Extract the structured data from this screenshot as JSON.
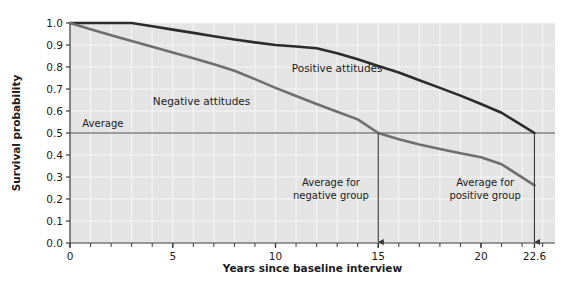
{
  "chart_data": {
    "type": "line",
    "title": "",
    "xlabel": "Years since baseline interview",
    "ylabel": "Survival probability",
    "xlim": [
      0,
      23.6
    ],
    "ylim": [
      0,
      1.0
    ],
    "grid": true,
    "legend_position": "inline-annotations",
    "xticks": [
      0,
      5,
      10,
      15,
      20,
      22.6
    ],
    "xtick_labels": [
      "0",
      "5",
      "10",
      "15",
      "20",
      "22.6"
    ],
    "yticks": [
      0.0,
      0.1,
      0.2,
      0.3,
      0.4,
      0.5,
      0.6,
      0.7,
      0.8,
      0.9,
      1.0
    ],
    "ytick_labels": [
      "0.0",
      "0.1",
      "0.2",
      "0.3",
      "0.4",
      "0.5",
      "0.6",
      "0.7",
      "0.8",
      "0.9",
      "1.0"
    ],
    "series": [
      {
        "name": "Positive attitudes",
        "color": "#2b2b2b",
        "label_x": 13.0,
        "label_y": 0.795,
        "x": [
          0,
          1,
          2,
          3,
          4,
          5,
          6,
          7,
          8,
          9,
          10,
          11,
          12,
          13,
          14,
          15,
          16,
          17,
          18,
          19,
          20,
          21,
          22,
          22.6
        ],
        "values": [
          1.0,
          1.0,
          1.0,
          1.0,
          0.985,
          0.97,
          0.955,
          0.94,
          0.925,
          0.912,
          0.9,
          0.893,
          0.885,
          0.862,
          0.835,
          0.805,
          0.775,
          0.74,
          0.705,
          0.67,
          0.632,
          0.592,
          0.535,
          0.5
        ]
      },
      {
        "name": "Negative attitudes",
        "color": "#6e6e6e",
        "label_x": 6.4,
        "label_y": 0.645,
        "x": [
          0,
          1,
          2,
          3,
          4,
          5,
          6,
          7,
          8,
          9,
          10,
          11,
          12,
          13,
          14,
          15,
          16,
          17,
          18,
          19,
          20,
          21,
          22,
          22.6
        ],
        "values": [
          1.0,
          0.972,
          0.944,
          0.918,
          0.892,
          0.866,
          0.84,
          0.812,
          0.783,
          0.745,
          0.705,
          0.668,
          0.632,
          0.597,
          0.562,
          0.5,
          0.472,
          0.448,
          0.427,
          0.408,
          0.39,
          0.358,
          0.298,
          0.262
        ]
      }
    ],
    "reference_lines": [
      {
        "name": "average-line",
        "orientation": "horizontal",
        "value": 0.5,
        "label": "Average",
        "label_x": 0.6,
        "label_y": 0.545,
        "color": "#4a4a4a"
      }
    ],
    "annotations": [
      {
        "name": "negative-group-arrow",
        "label_line1": "Average for",
        "label_line2": "negative group",
        "x_value": 15,
        "label_x": 12.7,
        "label_y_line1": 0.275,
        "label_y_line2": 0.215,
        "arrow_from_y": 0.5,
        "arrow_to_y": 0.0
      },
      {
        "name": "positive-group-arrow",
        "label_line1": "Average for",
        "label_line2": "positive group",
        "x_value": 22.6,
        "label_x": 20.2,
        "label_y_line1": 0.275,
        "label_y_line2": 0.215,
        "arrow_from_y": 0.5,
        "arrow_to_y": 0.0
      }
    ],
    "colors": {
      "plot_background": "#e4e4e4",
      "gridline": "#f6f6f6",
      "axis": "#3a3a3a",
      "positive_series": "#2b2b2b",
      "negative_series": "#6e6e6e",
      "annotation": "#4a4a4a"
    }
  }
}
